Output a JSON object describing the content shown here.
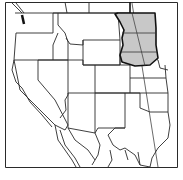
{
  "map": {
    "type": "locator-map",
    "region": "Western United States",
    "highlighted_region": "Northern Great Plains (Dakotas)",
    "colors": {
      "background": "#ffffff",
      "border": "#222222",
      "highlight_fill": "#c8c8c8",
      "highlight_outline": "#111111"
    },
    "labels": []
  }
}
